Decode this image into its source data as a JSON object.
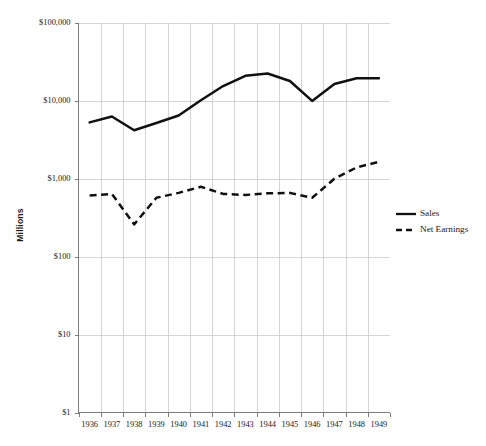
{
  "chart_data": {
    "type": "line",
    "title": "",
    "subtitle": "",
    "xlabel": "",
    "ylabel": "Millions",
    "yscale": "log",
    "ylim": [
      1,
      100000
    ],
    "grid": true,
    "legend_position": "right",
    "categories": [
      "1936",
      "1937",
      "1938",
      "1939",
      "1940",
      "1941",
      "1942",
      "1943",
      "1944",
      "1945",
      "1946",
      "1947",
      "1948",
      "1949"
    ],
    "x": [
      1936,
      1937,
      1938,
      1939,
      1940,
      1941,
      1942,
      1943,
      1944,
      1945,
      1946,
      1947,
      1948,
      1949
    ],
    "ytick_labels": [
      "$100,000",
      "$10,000",
      "$1,000",
      "$100",
      "$10",
      "$1"
    ],
    "ytick_values": [
      100000,
      10000,
      1000,
      100,
      10,
      1
    ],
    "series": [
      {
        "name": "Sales",
        "style": "solid",
        "color": "#111111",
        "values": [
          5300,
          6300,
          4200,
          5200,
          6500,
          10200,
          15500,
          21000,
          22500,
          18000,
          10000,
          16500,
          19500,
          19500
        ]
      },
      {
        "name": "Net Earnings",
        "style": "dashed",
        "color": "#111111",
        "values": [
          610,
          640,
          260,
          570,
          660,
          790,
          640,
          620,
          650,
          660,
          570,
          1000,
          1400,
          1650
        ]
      }
    ]
  },
  "legend": {
    "items": [
      {
        "label": "Sales",
        "style": "solid"
      },
      {
        "label": "Net Earnings",
        "style": "dashed"
      }
    ]
  }
}
